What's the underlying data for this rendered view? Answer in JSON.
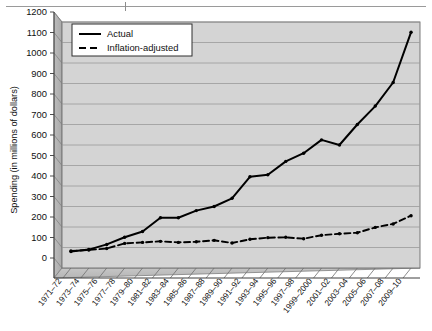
{
  "chart_data": {
    "type": "line",
    "title": "",
    "xlabel": "",
    "ylabel": "Spending (in millions of dollars)",
    "ylim": [
      0,
      1200
    ],
    "ytick_step": 100,
    "yticks": [
      0,
      100,
      200,
      300,
      400,
      500,
      600,
      700,
      800,
      900,
      1000,
      1100,
      1200
    ],
    "grid": true,
    "legend_position": "top-left",
    "categories": [
      "1971–72",
      "1973–74",
      "1975–76",
      "1977–78",
      "1979–80",
      "1981–82",
      "1983–84",
      "1985–86",
      "1987–88",
      "1989–90",
      "1991–92",
      "1993–94",
      "1995–96",
      "1997–98",
      "1999–2000",
      "2001–02",
      "2003–04",
      "2005–06",
      "2007–08",
      "2009–10"
    ],
    "series": [
      {
        "name": "Actual",
        "style": "solid",
        "color": "#000000",
        "values": [
          80,
          90,
          115,
          150,
          178,
          245,
          245,
          280,
          300,
          340,
          445,
          455,
          520,
          560,
          625,
          600,
          700,
          790,
          905,
          1150
        ]
      },
      {
        "name": "Inflation-adjusted",
        "style": "dashed",
        "color": "#000000",
        "values": [
          83,
          88,
          95,
          120,
          125,
          130,
          125,
          128,
          135,
          122,
          140,
          148,
          150,
          143,
          160,
          167,
          172,
          198,
          215,
          255
        ]
      }
    ]
  },
  "legend": {
    "entries": [
      {
        "label": "Actual",
        "style": "solid"
      },
      {
        "label": "Inflation-adjusted",
        "style": "dashed"
      }
    ]
  },
  "colors": {
    "plot_background": "#d4d4d4",
    "gridline": "#9b9b9b",
    "axis": "#4a4a4a",
    "series": "#000000",
    "legend_background": "#ffffff",
    "page_background": "#ffffff"
  }
}
